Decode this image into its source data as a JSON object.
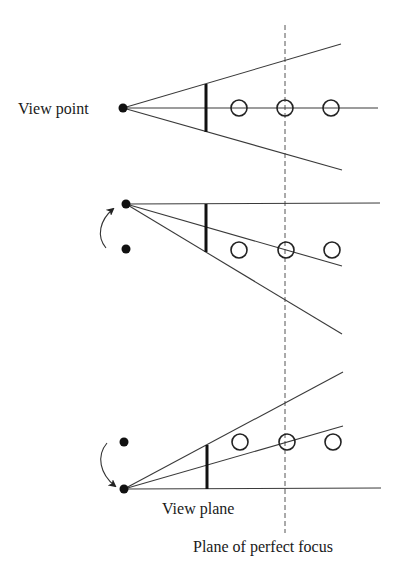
{
  "diagram": {
    "labels": {
      "view_point": "View point",
      "view_plane": "View plane",
      "plane_of_focus": "Plane of perfect focus"
    },
    "panels": [
      {
        "name": "original",
        "viewpoint": "centered",
        "objects": 3
      },
      {
        "name": "viewpoint-moved-up",
        "viewpoint": "shifted up",
        "objects": 3
      },
      {
        "name": "viewpoint-moved-down",
        "viewpoint": "shifted down",
        "objects": 3
      }
    ],
    "colors": {
      "ink": "#111111",
      "background": "#ffffff"
    }
  }
}
